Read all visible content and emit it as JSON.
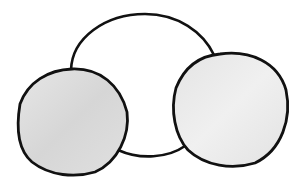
{
  "diagram": {
    "colors": {
      "background": "#ffffff",
      "stroke": "#111111",
      "center_fill": "#ffffff",
      "left_fill": "#dcdcdc",
      "right_fill": "#e8e8e8"
    },
    "circles": [
      {
        "name": "center",
        "cx": 143,
        "cy": 86,
        "r": 72
      },
      {
        "name": "left",
        "cx": 72,
        "cy": 122,
        "rx": 56,
        "ry": 54
      },
      {
        "name": "right",
        "cx": 230,
        "cy": 109,
        "rx": 58,
        "ry": 57
      }
    ]
  }
}
